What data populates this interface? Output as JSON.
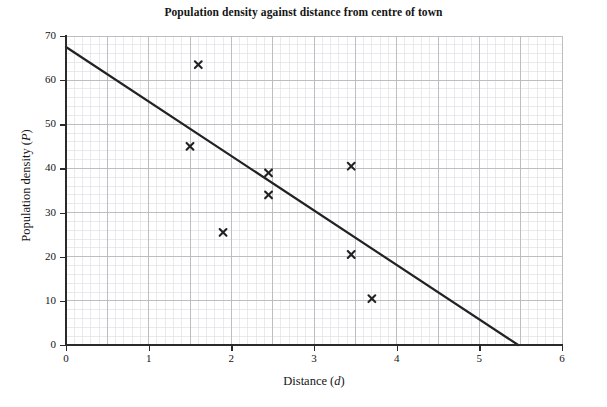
{
  "chart_data": {
    "type": "scatter",
    "title": "Population density against distance from centre of town",
    "xlabel": "Distance (d)",
    "xlabel_text": "Distance (",
    "xlabel_var": "d",
    "xlabel_tail": ")",
    "ylabel": "Population density (P)",
    "ylabel_text": "Population density (",
    "ylabel_var": "P",
    "ylabel_tail": ")",
    "xlim": [
      0,
      6
    ],
    "ylim": [
      0,
      70
    ],
    "xticks": [
      0,
      1,
      2,
      3,
      4,
      5,
      6
    ],
    "xtick_labels": [
      "0",
      "1",
      "2",
      "3",
      "4",
      "5",
      "6"
    ],
    "yticks": [
      0,
      10,
      20,
      30,
      40,
      50,
      60,
      70
    ],
    "ytick_labels": [
      "0",
      "10",
      "20",
      "30",
      "40",
      "50",
      "60",
      "70"
    ],
    "grid": true,
    "grid_major_x_step": 0.5,
    "grid_major_y_step": 10,
    "grid_minor_x_step": 0.1,
    "grid_minor_y_step": 2,
    "grid_major_color": "#b9b9bd",
    "grid_minor_color": "#dcdce0",
    "legend": "none",
    "marker": "x",
    "marker_color": "#222222",
    "points": [
      {
        "x": 1.6,
        "y": 63.5
      },
      {
        "x": 1.5,
        "y": 45.0
      },
      {
        "x": 1.9,
        "y": 25.5
      },
      {
        "x": 2.45,
        "y": 39.0
      },
      {
        "x": 2.45,
        "y": 34.0
      },
      {
        "x": 3.45,
        "y": 40.5
      },
      {
        "x": 3.45,
        "y": 20.5
      },
      {
        "x": 3.7,
        "y": 10.5
      }
    ],
    "series": [
      {
        "name": "Line of best fit",
        "type": "line",
        "color": "#222222",
        "x": [
          0,
          5.47
        ],
        "y": [
          67.5,
          0
        ]
      }
    ],
    "annotations": []
  }
}
